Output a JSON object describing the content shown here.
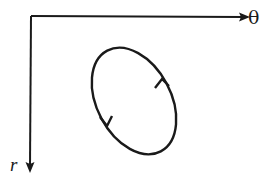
{
  "diagram": {
    "axes": {
      "horizontal_label": "θ",
      "vertical_label": "r"
    },
    "curve": {
      "shape": "closed-loop",
      "direction": "counterclockwise"
    },
    "colors": {
      "ink": "#1a1a1a",
      "background": "#ffffff"
    }
  }
}
